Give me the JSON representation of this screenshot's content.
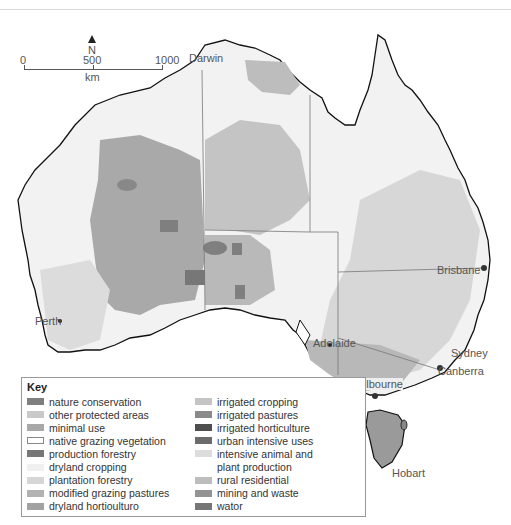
{
  "map": {
    "title": "Land use in Australia",
    "north_label": "N",
    "scale": {
      "ticks": [
        "0",
        "500",
        "1000"
      ],
      "unit": "km"
    },
    "cities": [
      {
        "name": "Darwin"
      },
      {
        "name": "Perth"
      },
      {
        "name": "Adelaide"
      },
      {
        "name": "Melbourne"
      },
      {
        "name": "Canberra"
      },
      {
        "name": "Sydney"
      },
      {
        "name": "Brisbane"
      },
      {
        "name": "Hobart"
      }
    ],
    "colors": {
      "land_base": "#f3f3f3",
      "coast": "#111111",
      "state_border": "#777777"
    }
  },
  "legend": {
    "title": "Key",
    "items": [
      {
        "label": "nature conservation",
        "color": "#7f7f7f"
      },
      {
        "label": "other protected areas",
        "color": "#c9c9c9"
      },
      {
        "label": "minimal use",
        "color": "#a8a8a8"
      },
      {
        "label": "native grazing vegetation",
        "color": "#ffffff",
        "outline": true
      },
      {
        "label": "production forestry",
        "color": "#777777"
      },
      {
        "label": "dryland cropping",
        "color": "#f0f0f0"
      },
      {
        "label": "plantation forestry",
        "color": "#d6d6d6"
      },
      {
        "label": "modified grazing pastures",
        "color": "#b2b2b2"
      },
      {
        "label": "dryland hortioulturo",
        "color": "#a2a2a2"
      },
      {
        "label": "irrigated cropping",
        "color": "#c4c4c4"
      },
      {
        "label": "irrigated pastures",
        "color": "#8a8a8a"
      },
      {
        "label": "irrigated horticulture",
        "color": "#4e4e4e"
      },
      {
        "label": "urban intensive uses",
        "color": "#6c6c6c"
      },
      {
        "label": "intensive animal and",
        "color": "#dcdcdc"
      },
      {
        "label": "plant production",
        "color": null
      },
      {
        "label": "rural residential",
        "color": "#bdbdbd"
      },
      {
        "label": "mining and waste",
        "color": "#939393"
      },
      {
        "label": "wator",
        "color": "#767676"
      }
    ]
  }
}
